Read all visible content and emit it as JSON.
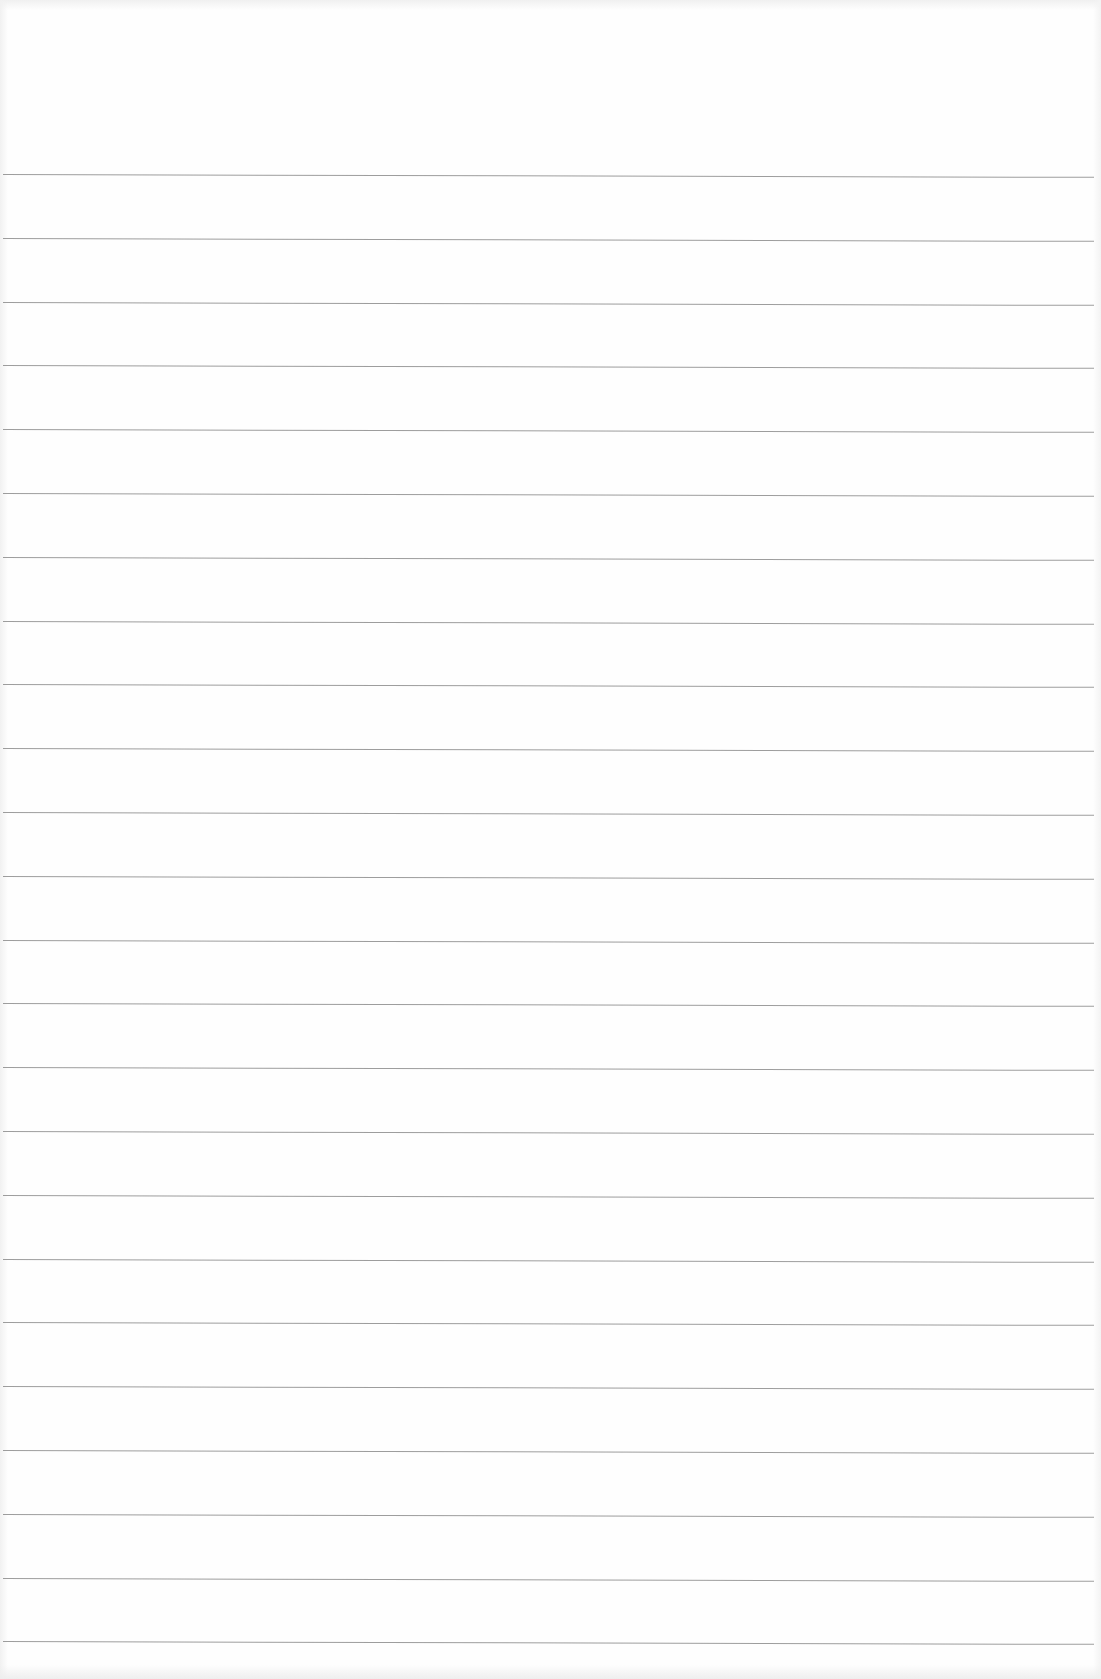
{
  "page": {
    "type": "lined-paper",
    "background_color": "#fefefe",
    "line_color": "#8c8c8c",
    "line_count": 24,
    "first_line_y": 174,
    "line_spacing": 63.8,
    "line_left_x": 3,
    "line_right_x": 1094
  }
}
